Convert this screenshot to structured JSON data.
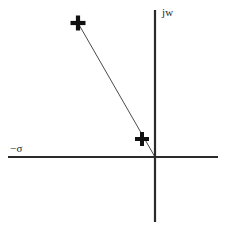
{
  "figure": {
    "background_color": "#ffffff",
    "width": 228,
    "height": 235
  },
  "axes": {
    "real_axis": {
      "label": "−σ",
      "label_name": "negative-sigma",
      "orientation": "horizontal",
      "color": "#2b2b2b",
      "x_start": 8,
      "x_end": 218,
      "y": 157,
      "stroke_width": 2.2
    },
    "imaginary_axis": {
      "label": "jw",
      "label_name": "j-omega",
      "orientation": "vertical",
      "color": "#2b2b2b",
      "x": 155,
      "y_start": 10,
      "y_end": 222,
      "stroke_width": 2.2
    },
    "origin": {
      "x": 155,
      "y": 157
    }
  },
  "chart_data": {
    "type": "scatter",
    "title": "",
    "subtitle": "",
    "xlabel": "−σ",
    "ylabel": "jw",
    "grid": false,
    "legend": "none",
    "marker_symbol": "+",
    "marker_color": "#111111",
    "series": [
      {
        "name": "poles",
        "marker": "+",
        "points": [
          {
            "name": "upper-pole",
            "px": 78,
            "py": 23,
            "label": "+"
          },
          {
            "name": "lower-pole",
            "px": 142,
            "py": 139,
            "label": "+"
          }
        ]
      }
    ],
    "annotations": [
      {
        "name": "pole-vector-line",
        "type": "line",
        "description": "line from upper pole through lower pole to the origin",
        "color": "#4a4a4a",
        "stroke_width": 1,
        "from": {
          "x": 78,
          "y": 23
        },
        "to": {
          "x": 155,
          "y": 157
        }
      }
    ]
  },
  "markers": {
    "upper": {
      "glyph": "+",
      "x": 78,
      "y": 23,
      "font_size": 20
    },
    "lower": {
      "glyph": "+",
      "x": 142,
      "y": 139,
      "font_size": 18
    }
  }
}
